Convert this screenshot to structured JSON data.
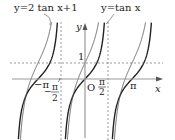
{
  "chart_data": {
    "type": "line",
    "title": "",
    "xlabel": "x",
    "ylabel": "y",
    "origin_label": "O",
    "series": [
      {
        "name": "y=tan x",
        "label": "y=tan x",
        "expr": "tan",
        "a": 1,
        "b": 0,
        "stroke_width": 1.4,
        "color": "#222222"
      },
      {
        "name": "y=2 tan x+1",
        "label": "y=2 tan x+1",
        "expr": "tan",
        "a": 2,
        "b": 1,
        "stroke_width": 0.8,
        "color": "#444444"
      }
    ],
    "x_ticks": [
      {
        "value": -3.14159,
        "label": "−π"
      },
      {
        "value": -1.5708,
        "label": "−π/2"
      },
      {
        "value": 1.5708,
        "label": "π/2"
      },
      {
        "value": 3.14159,
        "label": "π"
      }
    ],
    "y_ticks": [
      {
        "value": 1,
        "label": "1"
      }
    ],
    "asymptotes": [
      -1.5708,
      1.5708
    ],
    "dashed_horizontal": [
      1
    ],
    "xlim": [
      -3.7,
      4.1
    ],
    "ylim": [
      -3.8,
      4.8
    ],
    "grid": false
  },
  "labels": {
    "left_curve": "y=2 tan x+1",
    "right_curve": "y=tan x",
    "x_axis": "x",
    "y_axis": "y",
    "origin": "O",
    "one": "1",
    "neg_pi": "−π",
    "pi": "π",
    "half_pi_num": "π",
    "half_pi_den": "2",
    "neg_half_minus": "−"
  }
}
